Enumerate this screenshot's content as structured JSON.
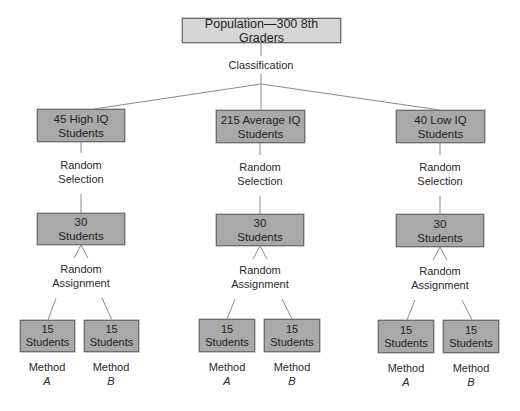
{
  "root": {
    "label": "Population—300 8th Graders"
  },
  "classification_label": "Classification",
  "colors": {
    "root_fill": "#d6d6d6",
    "box_fill": "#a9a9a9",
    "border": "#6e6e6e",
    "line": "#8a8a8a"
  },
  "groups": [
    {
      "id": "high",
      "box_line1": "45 High IQ",
      "box_line2": "Students",
      "selection_line1": "Random",
      "selection_line2": "Selection",
      "sample_line1": "30",
      "sample_line2": "Students",
      "assignment_line1": "Random",
      "assignment_line2": "Assignment",
      "leaves": [
        {
          "count": "15",
          "unit": "Students",
          "method": "Method",
          "method_letter": "A"
        },
        {
          "count": "15",
          "unit": "Students",
          "method": "Method",
          "method_letter": "B"
        }
      ]
    },
    {
      "id": "average",
      "box_line1": "215 Average IQ",
      "box_line2": "Students",
      "selection_line1": "Random",
      "selection_line2": "Selection",
      "sample_line1": "30",
      "sample_line2": "Students",
      "assignment_line1": "Random",
      "assignment_line2": "Assignment",
      "leaves": [
        {
          "count": "15",
          "unit": "Students",
          "method": "Method",
          "method_letter": "A"
        },
        {
          "count": "15",
          "unit": "Students",
          "method": "Method",
          "method_letter": "B"
        }
      ]
    },
    {
      "id": "low",
      "box_line1": "40 Low IQ",
      "box_line2": "Students",
      "selection_line1": "Random",
      "selection_line2": "Selection",
      "sample_line1": "30",
      "sample_line2": "Students",
      "assignment_line1": "Random",
      "assignment_line2": "Assignment",
      "leaves": [
        {
          "count": "15",
          "unit": "Students",
          "method": "Method",
          "method_letter": "A"
        },
        {
          "count": "15",
          "unit": "Students",
          "method": "Method",
          "method_letter": "B"
        }
      ]
    }
  ]
}
